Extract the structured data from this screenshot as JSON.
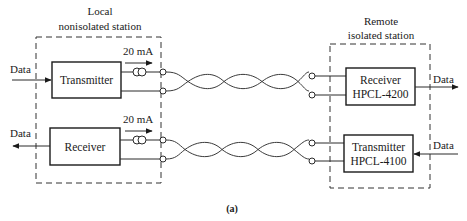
{
  "figure": {
    "caption": "(a)",
    "colors": {
      "line": "#1a1a1a",
      "background": "#ffffff"
    }
  },
  "local_station": {
    "title_line1": "Local",
    "title_line2": "nonisolated station",
    "transmitter": {
      "label": "Transmitter",
      "input_label": "Data",
      "current_label": "20 mA"
    },
    "receiver": {
      "label": "Receiver",
      "output_label": "Data",
      "current_label": "20 mA"
    }
  },
  "remote_station": {
    "title_line1": "Remote",
    "title_line2": "isolated station",
    "receiver": {
      "label": "Receiver",
      "part": "HPCL-4200",
      "output_label": "Data"
    },
    "transmitter": {
      "label": "Transmitter",
      "part": "HPCL-4100",
      "input_label": "Data"
    }
  },
  "links": [
    {
      "name": "top-twisted-pair",
      "from": "local_transmitter",
      "to": "remote_receiver"
    },
    {
      "name": "bottom-twisted-pair",
      "from": "local_receiver",
      "to": "remote_transmitter"
    }
  ]
}
